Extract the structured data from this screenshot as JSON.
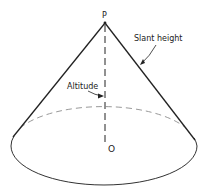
{
  "diagram": {
    "labels": {
      "apex": "P",
      "center": "O",
      "slant_height": "Slant height",
      "altitude": "Altitude"
    },
    "colors": {
      "stroke": "#222222",
      "dashed": "#888888",
      "background": "#ffffff"
    }
  }
}
